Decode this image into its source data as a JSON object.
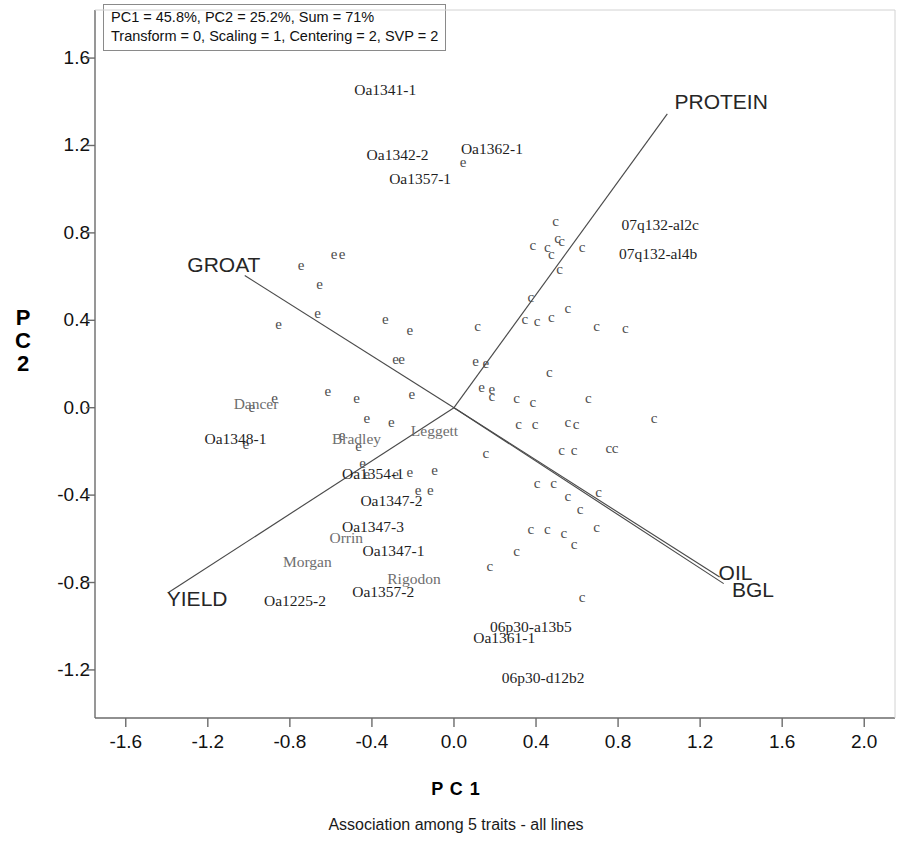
{
  "legend": {
    "line1": "PC1 = 45.8%, PC2 = 25.2%, Sum = 71%",
    "line2": "Transform = 0, Scaling = 1, Centering = 2, SVP = 2"
  },
  "axes": {
    "xlabel": "P C 1",
    "ylabel": "P C 2",
    "caption": "Association among 5 traits -  all lines"
  },
  "chart_data": {
    "type": "scatter",
    "title": "Association among 5 traits -  all lines",
    "subtitle": "PC1 = 45.8%, PC2 = 25.2%, Sum = 71%",
    "xlabel": "P C 1",
    "ylabel": "P C 2",
    "xlim": [
      -1.75,
      2.15
    ],
    "ylim": [
      -1.42,
      1.82
    ],
    "xticks": [
      "-1.6",
      "-1.2",
      "-0.8",
      "-0.4",
      "0.0",
      "0.4",
      "0.8",
      "1.2",
      "1.6",
      "2.0"
    ],
    "xtick_values": [
      -1.6,
      -1.2,
      -0.8,
      -0.4,
      0.0,
      0.4,
      0.8,
      1.2,
      1.6,
      2.0
    ],
    "yticks": [
      "1.6",
      "1.2",
      "0.8",
      "0.4",
      "0.0",
      "-0.4",
      "-0.8",
      "-1.2"
    ],
    "ytick_values": [
      1.6,
      1.2,
      0.8,
      0.4,
      0.0,
      -0.4,
      -0.8,
      -1.2
    ],
    "grid": false,
    "legend_position": "top-left-box",
    "variance_explained": {
      "PC1": 45.8,
      "PC2": 25.2,
      "sum": 71
    },
    "parameters": {
      "Transform": 0,
      "Scaling": 1,
      "Centering": 2,
      "SVP": 2
    },
    "marker_groups": [
      {
        "name": "experimental-lines",
        "glyph": "e",
        "color": "#4d4d4d"
      },
      {
        "name": "check-lines",
        "glyph": "c",
        "color": "#4d4d4d"
      }
    ],
    "vectors": [
      {
        "label": "PROTEIN",
        "x": 1.04,
        "y": 1.345,
        "label_x": 1.075,
        "label_y": 1.4
      },
      {
        "label": "GROAT",
        "x": -1.02,
        "y": 0.605,
        "label_x": -1.3,
        "label_y": 0.655
      },
      {
        "label": "YIELD",
        "x": -1.39,
        "y": -0.845,
        "label_x": -1.4,
        "label_y": -0.875
      },
      {
        "label": "OIL",
        "x": 1.295,
        "y": -0.775,
        "label_x": 1.29,
        "label_y": -0.755
      },
      {
        "label": "BGL",
        "x": 1.315,
        "y": -0.805,
        "label_x": 1.355,
        "label_y": -0.835
      }
    ],
    "points": [
      {
        "glyph": "e",
        "x": -0.745,
        "y": 0.655
      },
      {
        "glyph": "e",
        "x": -0.585,
        "y": 0.705
      },
      {
        "glyph": "e",
        "x": -0.545,
        "y": 0.705
      },
      {
        "glyph": "e",
        "x": -0.655,
        "y": 0.565
      },
      {
        "glyph": "e",
        "x": -0.665,
        "y": 0.435
      },
      {
        "glyph": "e",
        "x": -0.855,
        "y": 0.385
      },
      {
        "glyph": "e",
        "x": -0.335,
        "y": 0.405
      },
      {
        "glyph": "e",
        "x": -0.215,
        "y": 0.355
      },
      {
        "glyph": "e",
        "x": -0.285,
        "y": 0.225
      },
      {
        "glyph": "e",
        "x": -0.255,
        "y": 0.225
      },
      {
        "glyph": "e",
        "x": -0.615,
        "y": 0.075
      },
      {
        "glyph": "e",
        "x": -0.875,
        "y": 0.045
      },
      {
        "glyph": "e",
        "x": -0.475,
        "y": 0.045
      },
      {
        "glyph": "e",
        "x": -0.205,
        "y": 0.065
      },
      {
        "glyph": "e",
        "x": -0.425,
        "y": -0.045
      },
      {
        "glyph": "e",
        "x": -0.305,
        "y": -0.065
      },
      {
        "glyph": "e",
        "x": -0.985,
        "y": 0.005
      },
      {
        "glyph": "e",
        "x": -1.015,
        "y": -0.165
      },
      {
        "glyph": "e",
        "x": -0.545,
        "y": -0.125
      },
      {
        "glyph": "e",
        "x": -0.465,
        "y": -0.175
      },
      {
        "glyph": "e",
        "x": -0.445,
        "y": -0.255
      },
      {
        "glyph": "e",
        "x": -0.425,
        "y": -0.305
      },
      {
        "glyph": "e",
        "x": -0.285,
        "y": -0.305
      },
      {
        "glyph": "e",
        "x": -0.215,
        "y": -0.295
      },
      {
        "glyph": "e",
        "x": -0.175,
        "y": -0.375
      },
      {
        "glyph": "e",
        "x": -0.115,
        "y": -0.375
      },
      {
        "glyph": "e",
        "x": 0.105,
        "y": 0.215
      },
      {
        "glyph": "e",
        "x": 0.155,
        "y": 0.205
      },
      {
        "glyph": "e",
        "x": 0.135,
        "y": 0.095
      },
      {
        "glyph": "e",
        "x": 0.185,
        "y": 0.085
      },
      {
        "glyph": "c",
        "x": 0.495,
        "y": 0.855
      },
      {
        "glyph": "c",
        "x": 0.505,
        "y": 0.775
      },
      {
        "glyph": "c",
        "x": 0.525,
        "y": 0.765
      },
      {
        "glyph": "c",
        "x": 0.385,
        "y": 0.745
      },
      {
        "glyph": "c",
        "x": 0.455,
        "y": 0.735
      },
      {
        "glyph": "c",
        "x": 0.475,
        "y": 0.705
      },
      {
        "glyph": "c",
        "x": 0.625,
        "y": 0.735
      },
      {
        "glyph": "c",
        "x": 0.515,
        "y": 0.635
      },
      {
        "glyph": "c",
        "x": 0.375,
        "y": 0.505
      },
      {
        "glyph": "c",
        "x": 0.555,
        "y": 0.455
      },
      {
        "glyph": "c",
        "x": 0.345,
        "y": 0.405
      },
      {
        "glyph": "c",
        "x": 0.405,
        "y": 0.395
      },
      {
        "glyph": "c",
        "x": 0.475,
        "y": 0.415
      },
      {
        "glyph": "c",
        "x": 0.695,
        "y": 0.375
      },
      {
        "glyph": "c",
        "x": 0.835,
        "y": 0.365
      },
      {
        "glyph": "c",
        "x": 0.115,
        "y": 0.375
      },
      {
        "glyph": "c",
        "x": 0.465,
        "y": 0.165
      },
      {
        "glyph": "c",
        "x": 0.185,
        "y": 0.055
      },
      {
        "glyph": "c",
        "x": 0.305,
        "y": 0.045
      },
      {
        "glyph": "c",
        "x": 0.385,
        "y": 0.025
      },
      {
        "glyph": "c",
        "x": 0.655,
        "y": 0.045
      },
      {
        "glyph": "c",
        "x": 0.315,
        "y": -0.075
      },
      {
        "glyph": "c",
        "x": 0.395,
        "y": -0.075
      },
      {
        "glyph": "c",
        "x": 0.555,
        "y": -0.065
      },
      {
        "glyph": "c",
        "x": 0.595,
        "y": -0.075
      },
      {
        "glyph": "c",
        "x": 0.975,
        "y": -0.045
      },
      {
        "glyph": "c",
        "x": 0.155,
        "y": -0.205
      },
      {
        "glyph": "c",
        "x": 0.525,
        "y": -0.195
      },
      {
        "glyph": "c",
        "x": 0.585,
        "y": -0.195
      },
      {
        "glyph": "c",
        "x": 0.755,
        "y": -0.185
      },
      {
        "glyph": "c",
        "x": 0.785,
        "y": -0.185
      },
      {
        "glyph": "c",
        "x": 0.405,
        "y": -0.345
      },
      {
        "glyph": "c",
        "x": 0.485,
        "y": -0.345
      },
      {
        "glyph": "c",
        "x": 0.555,
        "y": -0.405
      },
      {
        "glyph": "c",
        "x": 0.705,
        "y": -0.385
      },
      {
        "glyph": "c",
        "x": 0.615,
        "y": -0.465
      },
      {
        "glyph": "c",
        "x": 0.375,
        "y": -0.555
      },
      {
        "glyph": "c",
        "x": 0.455,
        "y": -0.555
      },
      {
        "glyph": "c",
        "x": 0.535,
        "y": -0.575
      },
      {
        "glyph": "c",
        "x": 0.695,
        "y": -0.545
      },
      {
        "glyph": "c",
        "x": 0.585,
        "y": -0.625
      },
      {
        "glyph": "c",
        "x": 0.305,
        "y": -0.655
      },
      {
        "glyph": "c",
        "x": 0.175,
        "y": -0.725
      },
      {
        "glyph": "c",
        "x": 0.625,
        "y": -0.865
      },
      {
        "glyph": "e",
        "x": 0.045,
        "y": 1.125
      },
      {
        "glyph": "e",
        "x": -0.095,
        "y": -0.285
      }
    ],
    "point_labels": [
      {
        "text": "Oa1341-1",
        "x": -0.335,
        "y": 1.455,
        "style": "dark"
      },
      {
        "text": "Oa1342-2",
        "x": -0.275,
        "y": 1.155,
        "style": "dark"
      },
      {
        "text": "Oa1362-1",
        "x": 0.185,
        "y": 1.185,
        "style": "dark"
      },
      {
        "text": "Oa1357-1",
        "x": -0.165,
        "y": 1.045,
        "style": "dark"
      },
      {
        "text": "07q132-al2c",
        "x": 1.005,
        "y": 0.835,
        "style": "dark"
      },
      {
        "text": "07q132-al4b",
        "x": 0.995,
        "y": 0.705,
        "style": "dark"
      },
      {
        "text": "Dancer",
        "x": -0.965,
        "y": 0.015,
        "style": "gray"
      },
      {
        "text": "Oa1348-1",
        "x": -1.065,
        "y": -0.145,
        "style": "dark"
      },
      {
        "text": "Bradley",
        "x": -0.475,
        "y": -0.145,
        "style": "gray"
      },
      {
        "text": "Leggett",
        "x": -0.095,
        "y": -0.105,
        "style": "gray"
      },
      {
        "text": "Oa1354-1",
        "x": -0.395,
        "y": -0.305,
        "style": "dark"
      },
      {
        "text": "Oa1347-2",
        "x": -0.305,
        "y": -0.425,
        "style": "dark"
      },
      {
        "text": "Oa1347-3",
        "x": -0.395,
        "y": -0.545,
        "style": "dark"
      },
      {
        "text": "Orrin",
        "x": -0.525,
        "y": -0.595,
        "style": "gray"
      },
      {
        "text": "Oa1347-1",
        "x": -0.295,
        "y": -0.655,
        "style": "dark"
      },
      {
        "text": "Morgan",
        "x": -0.715,
        "y": -0.705,
        "style": "gray"
      },
      {
        "text": "Rigodon",
        "x": -0.195,
        "y": -0.785,
        "style": "gray"
      },
      {
        "text": "Oa1357-2",
        "x": -0.345,
        "y": -0.845,
        "style": "dark"
      },
      {
        "text": "Oa1225-2",
        "x": -0.775,
        "y": -0.885,
        "style": "dark"
      },
      {
        "text": "Oa1361-1",
        "x": 0.245,
        "y": -1.055,
        "style": "dark"
      },
      {
        "text": "06p30-a13b5",
        "x": 0.375,
        "y": -1.005,
        "style": "dark"
      },
      {
        "text": "06p30-d12b2",
        "x": 0.435,
        "y": -1.235,
        "style": "dark"
      }
    ]
  }
}
